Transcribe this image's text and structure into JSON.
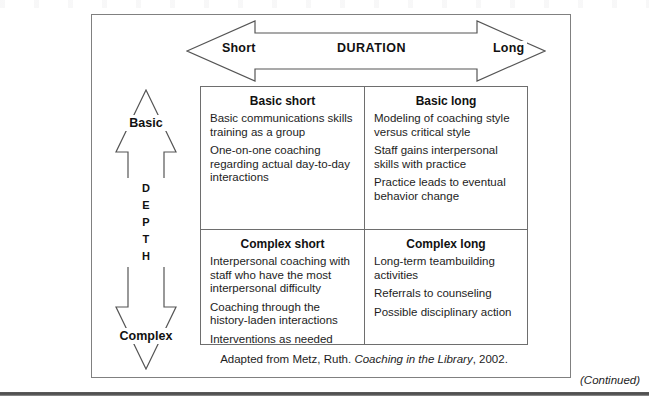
{
  "figure": {
    "horizontal_axis": {
      "name": "DURATION",
      "low_label": "Short",
      "high_label": "Long"
    },
    "vertical_axis": {
      "name_letters": [
        "D",
        "E",
        "P",
        "T",
        "H"
      ],
      "top_label": "Basic",
      "bottom_label": "Complex"
    },
    "quadrants": [
      {
        "id": "basic-short",
        "title": "Basic short",
        "items": [
          "Basic communications skills training as a group",
          "One-on-one coaching regarding actual day-to-day interactions"
        ]
      },
      {
        "id": "basic-long",
        "title": "Basic long",
        "items": [
          "Modeling of coaching style versus critical style",
          "Staff gains interpersonal skills with practice",
          "Practice leads to eventual behavior change"
        ]
      },
      {
        "id": "complex-short",
        "title": "Complex short",
        "items": [
          "Interpersonal coaching with staff who have the most interpersonal difficulty",
          "Coaching through the history-laden interactions",
          "Interventions as needed"
        ]
      },
      {
        "id": "complex-long",
        "title": "Complex long",
        "items": [
          "Long-term teambuilding activities",
          "Referrals to counseling",
          "Possible disciplinary action"
        ]
      }
    ],
    "source_note": {
      "prefix": "Adapted from Metz, Ruth. ",
      "book_title": "Coaching in the Library",
      "suffix": ", 2002."
    },
    "continued_label": "(Continued)"
  },
  "colors": {
    "frame_border": "#808080",
    "matrix_border": "#6e6e6e",
    "arrow_stroke": "#555555",
    "text": "#1a1a1a",
    "page_background": "#ffffff"
  }
}
